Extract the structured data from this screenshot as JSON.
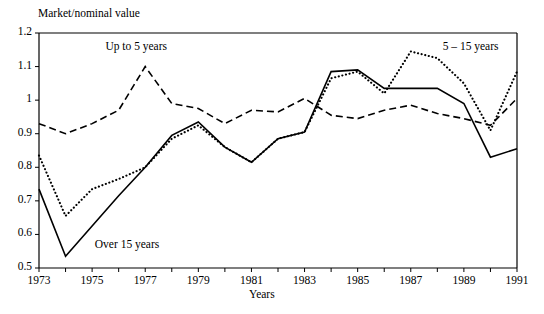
{
  "chart_data": {
    "type": "line",
    "title": "Market/nominal value",
    "xlabel": "Years",
    "ylabel": "Market/nominal value",
    "xlim": [
      1973,
      1991
    ],
    "ylim": [
      0.5,
      1.2
    ],
    "grid": false,
    "legend_position": "inline-annotations",
    "x": [
      1973,
      1974,
      1975,
      1976,
      1977,
      1978,
      1979,
      1980,
      1981,
      1982,
      1983,
      1984,
      1985,
      1986,
      1987,
      1988,
      1989,
      1990,
      1991
    ],
    "xtick_labels": [
      "1973",
      "1975",
      "1977",
      "1979",
      "1981",
      "1983",
      "1985",
      "1987",
      "1989",
      "1991"
    ],
    "xticks": [
      1973,
      1975,
      1977,
      1979,
      1981,
      1983,
      1985,
      1987,
      1989,
      1991
    ],
    "yticks": [
      0.5,
      0.6,
      0.7,
      0.8,
      0.9,
      1.0,
      1.1,
      1.2
    ],
    "ytick_labels": [
      "0.5",
      "0.6",
      "0.7",
      "0.8",
      "0.9",
      "1",
      "1.1",
      "1.2"
    ],
    "series": [
      {
        "name": "Up to 5 years",
        "style": "dashed",
        "label_x": 1975.5,
        "label_y": 1.155,
        "values": [
          0.93,
          0.9,
          0.93,
          0.97,
          1.1,
          0.99,
          0.975,
          0.93,
          0.97,
          0.965,
          1.005,
          0.955,
          0.945,
          0.97,
          0.985,
          0.96,
          0.945,
          0.925,
          1.005
        ]
      },
      {
        "name": "5 – 15 years",
        "style": "dotted",
        "label_x": 1988.2,
        "label_y": 1.155,
        "values": [
          0.835,
          0.655,
          0.735,
          0.765,
          0.8,
          0.885,
          0.925,
          0.86,
          0.815,
          0.885,
          0.905,
          1.065,
          1.085,
          1.02,
          1.145,
          1.125,
          1.05,
          0.91,
          1.085
        ]
      },
      {
        "name": "Over 15 years",
        "style": "solid",
        "label_x": 1975.1,
        "label_y": 0.565,
        "values": [
          0.735,
          0.535,
          0.625,
          0.715,
          0.8,
          0.895,
          0.935,
          0.86,
          0.815,
          0.885,
          0.905,
          1.085,
          1.09,
          1.035,
          1.035,
          1.035,
          0.99,
          0.83,
          0.855
        ]
      }
    ]
  },
  "annotations": {
    "up_to_5": "Up to 5 years",
    "five_to_15": "5 – 15 years",
    "over_15": "Over 15 years"
  },
  "axes": {
    "y_axis_title": "Market/nominal value",
    "x_axis_title": "Years"
  }
}
